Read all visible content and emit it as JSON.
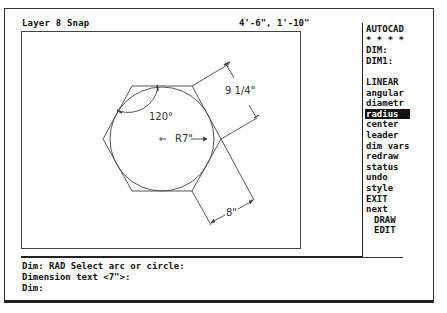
{
  "status_bar": {
    "layer_label": "Layer 8 Snap",
    "coordinates": "4'-6\", 1'-10\""
  },
  "drawing": {
    "shape": "hexagon-with-inscribed-circle",
    "dimensions": {
      "angle": "120°",
      "radius": "R7\"",
      "aligned_top": "9 1/4\"",
      "aligned_bottom": "8\""
    },
    "line_color": "#444444"
  },
  "side_menu": {
    "header": "AUTOCAD",
    "stars": "* * * *",
    "dim": "DIM:",
    "dim1": "DIM1:",
    "items": [
      {
        "label": "LINEAR",
        "selected": false
      },
      {
        "label": "angular",
        "selected": false
      },
      {
        "label": "diametr",
        "selected": false
      },
      {
        "label": "radius",
        "selected": true
      },
      {
        "label": "center",
        "selected": false
      },
      {
        "label": "leader",
        "selected": false
      },
      {
        "label": "dim vars",
        "selected": false
      },
      {
        "label": "redraw",
        "selected": false
      },
      {
        "label": "status",
        "selected": false
      },
      {
        "label": "undo",
        "selected": false
      },
      {
        "label": "style",
        "selected": false
      },
      {
        "label": "EXIT",
        "selected": false
      },
      {
        "label": "next",
        "selected": false
      }
    ],
    "sub_items": [
      "DRAW",
      "EDIT"
    ]
  },
  "command_area": {
    "lines": [
      "Dim: RAD Select arc or circle:",
      "Dimension text <7\">:",
      "Dim:"
    ]
  },
  "colors": {
    "background": "#ffffff",
    "foreground": "#111111",
    "highlight_bg": "#111111",
    "highlight_fg": "#ffffff"
  }
}
